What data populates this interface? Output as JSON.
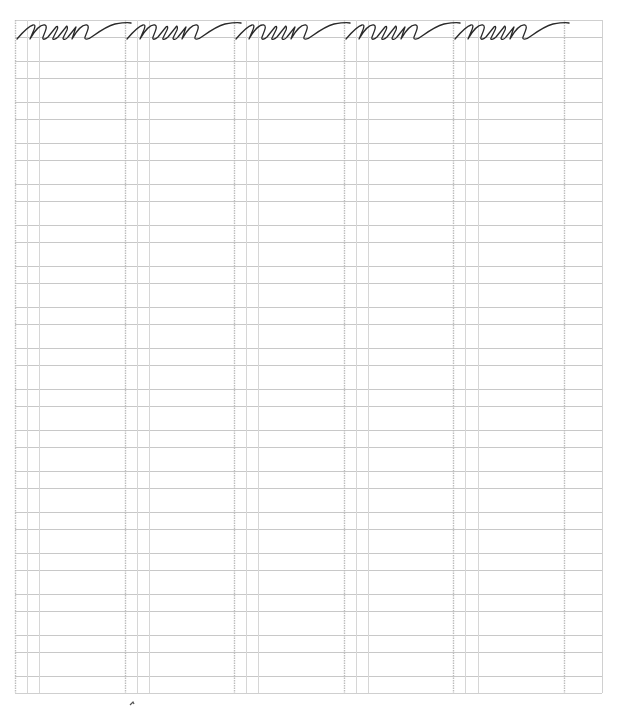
{
  "worksheet": {
    "type": "cursive handwriting practice sheet",
    "practice_word": "nun",
    "word_repetitions": 5,
    "stroke_color": "#2a2a2a",
    "grid_color": "#c8c8c8",
    "guide_color": "#d6d6d6",
    "border": {
      "left": 15,
      "top": 20,
      "right": 602,
      "bottom": 693
    },
    "row_lines_y": [
      20,
      37,
      61,
      78,
      102,
      119,
      143,
      160,
      184,
      201,
      225,
      242,
      266,
      283,
      307,
      324,
      348,
      365,
      389,
      406,
      430,
      447,
      471,
      488,
      512,
      529,
      553,
      570,
      594,
      611,
      635,
      652,
      676,
      693
    ],
    "column_groups": [
      {
        "dotted_x": 15,
        "solid_x": [
          27,
          39
        ]
      },
      {
        "dotted_x": 125,
        "solid_x": [
          137,
          149
        ]
      },
      {
        "dotted_x": 234,
        "solid_x": [
          246,
          258
        ]
      },
      {
        "dotted_x": 344,
        "solid_x": [
          356,
          368
        ]
      },
      {
        "dotted_x": 453,
        "solid_x": [
          465,
          478
        ]
      }
    ],
    "trailing_dotted_x": 564,
    "word_offsets_x": [
      15,
      125,
      234,
      344,
      453
    ]
  }
}
